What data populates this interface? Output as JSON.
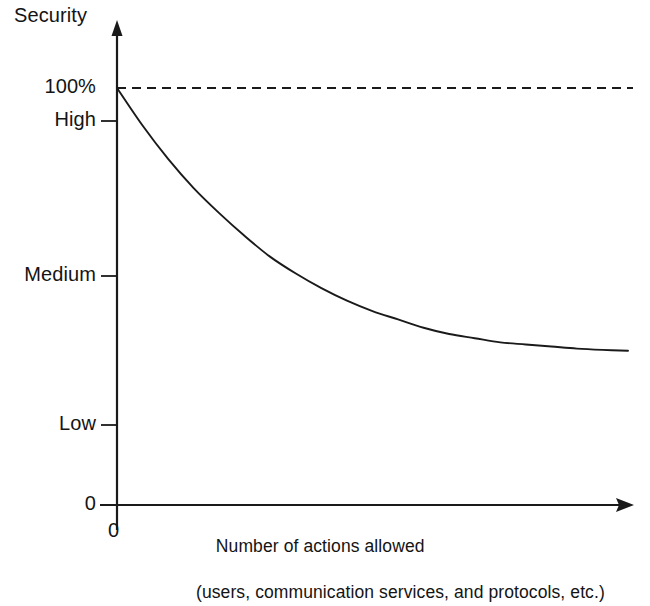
{
  "figure": {
    "background_color": "#ffffff",
    "line_color": "#1a1a1a",
    "axis_title_y": "Security",
    "origin_label": "0",
    "xaxis_caption_line1": "Number of actions allowed",
    "xaxis_caption_line2": "(users, communication services, and protocols, etc.)"
  },
  "yticks": {
    "pct100": "100%",
    "high": "High",
    "medium": "Medium",
    "low": "Low",
    "zero": "0"
  },
  "chart_data": {
    "type": "line",
    "title": "",
    "xlabel": "Number of actions allowed (users, communication services, and protocols, etc.)",
    "ylabel": "Security",
    "grid": false,
    "legend": "none",
    "xlim": [
      0,
      100
    ],
    "ylim": [
      0,
      100
    ],
    "ytick_values": [
      0,
      25,
      62,
      95,
      100
    ],
    "ytick_labels": [
      "0",
      "Low",
      "Medium",
      "High",
      "100%"
    ],
    "xtick_values": [
      0
    ],
    "xtick_labels": [
      "0"
    ],
    "series": [
      {
        "name": "Security level",
        "style": "solid",
        "description": "Exponential decay from 100% at zero actions toward an asymptote just above the Medium level",
        "x": [
          0,
          5,
          10,
          15,
          20,
          25,
          30,
          35,
          40,
          45,
          50,
          55,
          60,
          65,
          70,
          75,
          80,
          85,
          90,
          95,
          100
        ],
        "y": [
          100,
          91,
          83,
          76,
          70,
          64.5,
          59.5,
          55.5,
          52,
          49,
          46.5,
          44.5,
          42.5,
          41,
          40,
          39,
          38.5,
          38,
          37.5,
          37.2,
          37
        ]
      },
      {
        "name": "100% reference",
        "style": "dashed",
        "description": "Horizontal dashed line marking the 100% security level",
        "x": [
          0,
          100
        ],
        "y": [
          100,
          100
        ]
      }
    ],
    "annotations": [
      {
        "text": "Security",
        "role": "y-axis-title"
      },
      {
        "text": "0",
        "role": "x-axis-origin"
      },
      {
        "text": "Number of actions allowed",
        "role": "x-axis-caption-line-1"
      },
      {
        "text": "(users, communication services, and protocols, etc.)",
        "role": "x-axis-caption-line-2"
      }
    ]
  }
}
